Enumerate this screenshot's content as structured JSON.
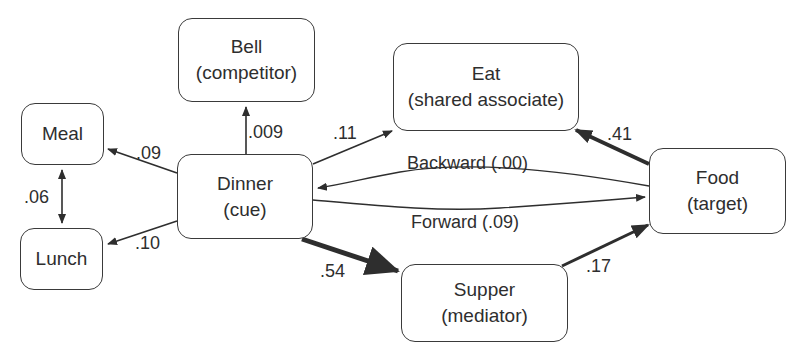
{
  "nodes": {
    "bell": {
      "name": "Bell",
      "role": "(competitor)"
    },
    "meal": {
      "name": "Meal",
      "role": ""
    },
    "lunch": {
      "name": "Lunch",
      "role": ""
    },
    "dinner": {
      "name": "Dinner",
      "role": "(cue)"
    },
    "eat": {
      "name": "Eat",
      "role": "(shared associate)"
    },
    "food": {
      "name": "Food",
      "role": "(target)"
    },
    "supper": {
      "name": "Supper",
      "role": "(mediator)"
    }
  },
  "edges": {
    "dinner_meal": {
      "from": "Dinner",
      "to": "Meal",
      "label": ".09"
    },
    "dinner_lunch": {
      "from": "Dinner",
      "to": "Lunch",
      "label": ".10"
    },
    "meal_lunch": {
      "from": "Meal",
      "to": "Lunch",
      "label": ".06",
      "bidirectional": true
    },
    "dinner_bell": {
      "from": "Dinner",
      "to": "Bell",
      "label": ".009"
    },
    "dinner_eat": {
      "from": "Dinner",
      "to": "Eat",
      "label": ".11"
    },
    "food_eat": {
      "from": "Food",
      "to": "Eat",
      "label": ".41"
    },
    "backward": {
      "from": "Food",
      "to": "Dinner",
      "label": "Backward (.00)"
    },
    "forward": {
      "from": "Dinner",
      "to": "Food",
      "label": "Forward (.09)"
    },
    "dinner_supper": {
      "from": "Dinner",
      "to": "Supper",
      "label": ".54"
    },
    "supper_food": {
      "from": "Supper",
      "to": "Food",
      "label": ".17"
    }
  },
  "colors": {
    "stroke": "#2e2e2e",
    "background": "#ffffff"
  }
}
